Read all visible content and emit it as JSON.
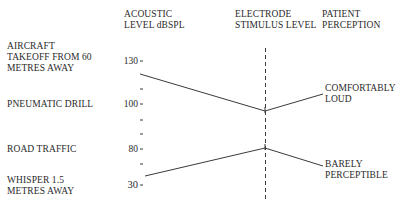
{
  "headers": {
    "acoustic": [
      "ACOUSTIC",
      "LEVEL dBSPL"
    ],
    "electrode": [
      "ELECTRODE",
      "STIMULUS LEVEL"
    ],
    "patient": [
      "PATIENT",
      "PERCEPTION"
    ]
  },
  "sound_sources": [
    {
      "lines": [
        "AIRCRAFT",
        "TAKEOFF FROM 60",
        "METRES AWAY"
      ]
    },
    {
      "lines": [
        "PNEUMATIC DRILL"
      ]
    },
    {
      "lines": [
        "ROAD TRAFFIC"
      ]
    },
    {
      "lines": [
        "WHISPER 1.5",
        "METRES AWAY"
      ]
    }
  ],
  "axis": {
    "tick_labels": [
      "130",
      "100",
      "80",
      "30"
    ]
  },
  "perceptions": [
    {
      "lines": [
        "COMFORTABLY",
        "LOUD"
      ]
    },
    {
      "lines": [
        "BARELY",
        "PERCEPTIBLE"
      ]
    }
  ],
  "colors": {
    "line": "#3a3a3a",
    "text": "#2a2a2a",
    "background": "#ffffff"
  }
}
